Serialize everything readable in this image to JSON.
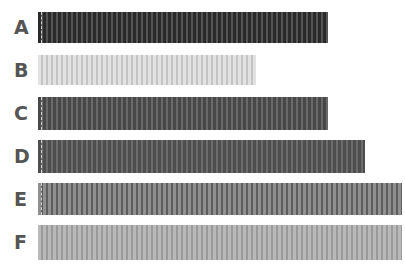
{
  "chart_data": {
    "type": "bar",
    "orientation": "horizontal",
    "title": "",
    "xlabel": "",
    "ylabel": "",
    "categories": [
      "A",
      "B",
      "C",
      "D",
      "E",
      "F"
    ],
    "values": [
      290,
      218,
      290,
      327,
      364,
      364
    ],
    "grid": false,
    "legend": null,
    "bars": [
      {
        "label": "A",
        "length_px": 290,
        "color": "#2a2a2a",
        "stripe": "#555555",
        "top": 12,
        "height": 31
      },
      {
        "label": "B",
        "length_px": 218,
        "color": "#e2e2e2",
        "stripe": "#c4c4c4",
        "top": 55,
        "height": 30
      },
      {
        "label": "C",
        "length_px": 290,
        "color": "#484848",
        "stripe": "#6a6a6a",
        "top": 97,
        "height": 33
      },
      {
        "label": "D",
        "length_px": 327,
        "color": "#4e4e4e",
        "stripe": "#6c6c6c",
        "top": 140,
        "height": 33
      },
      {
        "label": "E",
        "length_px": 364,
        "color": "#8f8f8f",
        "stripe": "#5e5e5e",
        "top": 183,
        "height": 32
      },
      {
        "label": "F",
        "length_px": 364,
        "color": "#b9b9b9",
        "stripe": "#9a9a9a",
        "top": 225,
        "height": 35
      }
    ]
  }
}
